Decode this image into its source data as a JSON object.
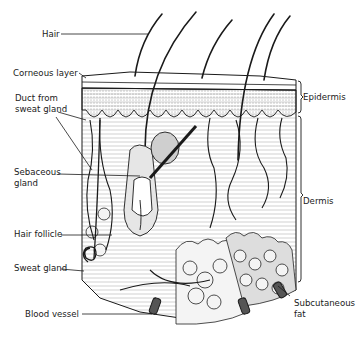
{
  "diagram": {
    "colors": {
      "ink": "#1a1a1a",
      "paper": "#ffffff",
      "fat": "#f2f2f2"
    },
    "labels_left": [
      {
        "id": "hair",
        "text": "Hair",
        "x": 42,
        "y": 10
      },
      {
        "id": "corneous-layer",
        "text": "Corneous layer",
        "x": 13,
        "y": 68
      },
      {
        "id": "duct-from-sweat-gland",
        "line1": "Duct from",
        "line2": "sweat gland",
        "x": 15,
        "y": 93
      },
      {
        "id": "sebaceous-gland",
        "line1": "Sebaceous",
        "line2": "gland",
        "x": 14,
        "y": 164
      },
      {
        "id": "hair-follicle",
        "text": "Hair follicle",
        "x": 14,
        "y": 226
      },
      {
        "id": "sweat-gland",
        "text": "Sweat gland",
        "x": 14,
        "y": 262
      },
      {
        "id": "blood-vessel",
        "text": "Blood vessel",
        "x": 25,
        "y": 310
      }
    ],
    "labels_right": [
      {
        "id": "epidermis",
        "text": "Epidermis",
        "x": 303,
        "y": 92
      },
      {
        "id": "dermis",
        "text": "Dermis",
        "x": 303,
        "y": 196
      },
      {
        "id": "subcutaneous-fat",
        "line1": "Subcutaneous",
        "line2": "fat",
        "x": 294,
        "y": 299
      }
    ]
  }
}
